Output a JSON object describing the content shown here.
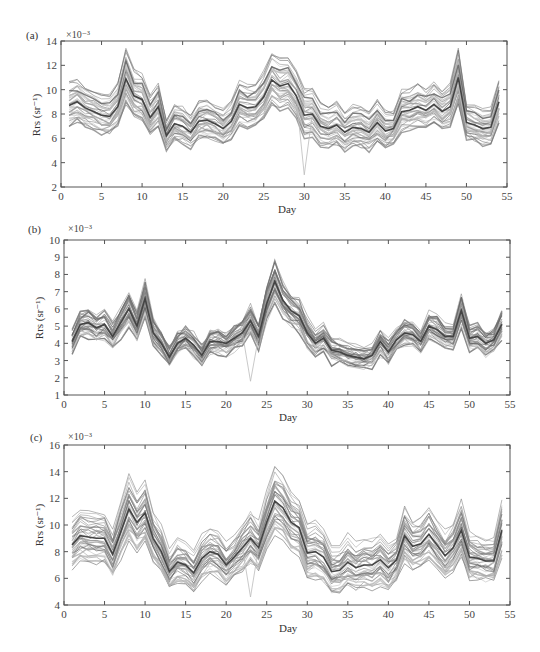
{
  "figure": {
    "panels": [
      "(a)",
      "(b)",
      "(c)"
    ]
  },
  "chart_data": [
    {
      "type": "line",
      "panel_label": "(a)",
      "title": "",
      "xlabel": "Day",
      "ylabel": "Rrs (sr⁻¹)",
      "y_multiplier": "×10⁻³",
      "xlim": [
        0,
        55
      ],
      "ylim": [
        2,
        14
      ],
      "xticks": [
        0,
        5,
        10,
        15,
        20,
        25,
        30,
        35,
        40,
        45,
        50,
        55
      ],
      "yticks": [
        2,
        4,
        6,
        8,
        10,
        12,
        14
      ],
      "grid": false,
      "legend": "none",
      "note": "Many overlapping gray spectral-band series; representative central series given",
      "x": [
        1,
        2,
        3,
        4,
        5,
        6,
        7,
        8,
        9,
        10,
        11,
        12,
        13,
        14,
        15,
        16,
        17,
        18,
        19,
        20,
        21,
        22,
        23,
        24,
        25,
        26,
        27,
        28,
        29,
        30,
        31,
        32,
        33,
        34,
        35,
        36,
        37,
        38,
        39,
        40,
        41,
        42,
        43,
        44,
        45,
        46,
        47,
        48,
        49,
        50,
        51,
        52,
        53,
        54
      ],
      "series": [
        {
          "name": "central",
          "values": [
            8.7,
            9.0,
            8.5,
            8.2,
            7.9,
            7.8,
            8.6,
            10.9,
            9.5,
            9.2,
            7.7,
            8.6,
            6.2,
            7.2,
            7.0,
            6.5,
            7.4,
            7.5,
            7.2,
            6.8,
            7.4,
            8.8,
            8.5,
            8.6,
            9.4,
            10.8,
            10.3,
            10.5,
            9.5,
            7.9,
            8.0,
            7.0,
            6.8,
            7.1,
            6.5,
            6.9,
            6.8,
            6.5,
            7.3,
            6.6,
            6.8,
            8.2,
            8.3,
            8.6,
            8.3,
            8.8,
            8.2,
            8.6,
            11.0,
            7.3,
            7.1,
            6.8,
            6.9,
            9.0
          ]
        }
      ],
      "spread": 1.0,
      "outliers": [
        {
          "x": 30,
          "y": 3.0
        }
      ]
    },
    {
      "type": "line",
      "panel_label": "(b)",
      "title": "",
      "xlabel": "Day",
      "ylabel": "Rrs (sr⁻¹)",
      "y_multiplier": "×10⁻³",
      "xlim": [
        0,
        55
      ],
      "ylim": [
        1,
        10
      ],
      "xticks": [
        0,
        5,
        10,
        15,
        20,
        25,
        30,
        35,
        40,
        45,
        50,
        55
      ],
      "yticks": [
        1,
        2,
        3,
        4,
        5,
        6,
        7,
        8,
        9,
        10
      ],
      "grid": false,
      "legend": "none",
      "x": [
        1,
        2,
        3,
        4,
        5,
        6,
        7,
        8,
        9,
        10,
        11,
        12,
        13,
        14,
        15,
        16,
        17,
        18,
        19,
        20,
        21,
        22,
        23,
        24,
        25,
        26,
        27,
        28,
        29,
        30,
        31,
        32,
        33,
        34,
        35,
        36,
        37,
        38,
        39,
        40,
        41,
        42,
        43,
        44,
        45,
        46,
        47,
        48,
        49,
        50,
        51,
        52,
        53,
        54
      ],
      "series": [
        {
          "name": "central",
          "values": [
            4.1,
            5.1,
            5.2,
            4.9,
            5.1,
            4.4,
            5.2,
            6.0,
            5.0,
            6.6,
            4.6,
            4.0,
            3.2,
            4.0,
            4.3,
            3.9,
            3.3,
            4.1,
            4.1,
            4.0,
            4.3,
            4.6,
            5.3,
            4.4,
            6.3,
            7.6,
            6.5,
            5.9,
            5.6,
            4.6,
            4.0,
            4.3,
            3.6,
            3.5,
            3.3,
            3.2,
            3.1,
            3.3,
            4.1,
            3.5,
            4.2,
            4.6,
            4.5,
            4.1,
            5.0,
            4.8,
            4.4,
            4.4,
            5.9,
            4.3,
            4.4,
            4.0,
            4.2,
            5.1
          ]
        }
      ],
      "spread": 0.8,
      "outliers": [
        {
          "x": 23,
          "y": 1.8
        }
      ]
    },
    {
      "type": "line",
      "panel_label": "(c)",
      "title": "",
      "xlabel": "Day",
      "ylabel": "Rrs (sr⁻¹)",
      "y_multiplier": "×10⁻³",
      "xlim": [
        0,
        55
      ],
      "ylim": [
        4,
        16
      ],
      "xticks": [
        0,
        5,
        10,
        15,
        20,
        25,
        30,
        35,
        40,
        45,
        50,
        55
      ],
      "yticks": [
        4,
        6,
        8,
        10,
        12,
        14,
        16
      ],
      "grid": false,
      "legend": "none",
      "x": [
        1,
        2,
        3,
        4,
        5,
        6,
        7,
        8,
        9,
        10,
        11,
        12,
        13,
        14,
        15,
        16,
        17,
        18,
        19,
        20,
        21,
        22,
        23,
        24,
        25,
        26,
        27,
        28,
        29,
        30,
        31,
        32,
        33,
        34,
        35,
        36,
        37,
        38,
        39,
        40,
        41,
        42,
        43,
        44,
        45,
        46,
        47,
        48,
        49,
        50,
        51,
        52,
        53,
        54
      ],
      "series": [
        {
          "name": "central",
          "values": [
            8.5,
            9.2,
            9.1,
            9.0,
            9.0,
            7.8,
            9.5,
            11.2,
            10.2,
            10.9,
            9.0,
            8.0,
            6.5,
            7.2,
            7.0,
            6.4,
            7.5,
            8.0,
            7.8,
            7.0,
            7.6,
            8.3,
            9.0,
            8.3,
            10.2,
            11.8,
            11.3,
            10.2,
            9.8,
            7.9,
            8.0,
            7.6,
            6.5,
            6.6,
            7.2,
            6.8,
            7.0,
            7.0,
            7.4,
            6.8,
            7.4,
            9.2,
            8.4,
            8.6,
            9.3,
            8.5,
            7.7,
            8.3,
            9.6,
            7.6,
            7.5,
            7.3,
            7.3,
            9.6
          ]
        }
      ],
      "spread": 1.1,
      "outliers": [
        {
          "x": 23,
          "y": 4.6
        }
      ]
    }
  ]
}
